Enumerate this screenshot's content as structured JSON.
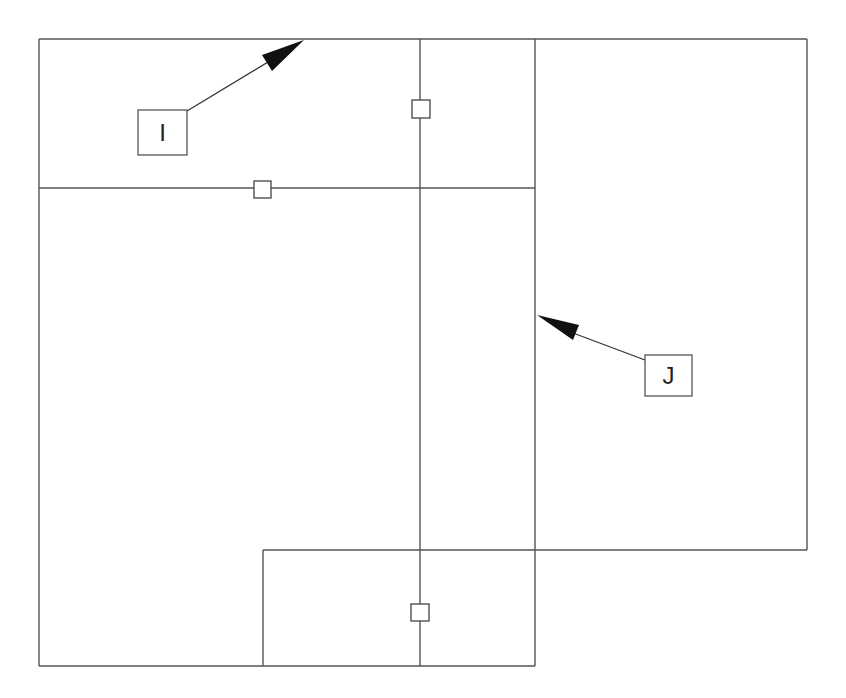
{
  "diagram": {
    "type": "floor-plan-outline",
    "canvas": {
      "width": 846,
      "height": 698,
      "background": "#ffffff"
    },
    "line_color": "#555555",
    "labels": [
      {
        "id": "I",
        "text": "I",
        "box": {
          "x": 138,
          "y": 110,
          "w": 49,
          "h": 45
        },
        "arrow_to": {
          "x": 304,
          "y": 40
        },
        "points_at": "top edge of upper-left region"
      },
      {
        "id": "J",
        "text": "J",
        "box": {
          "x": 645,
          "y": 355,
          "w": 47,
          "h": 41
        },
        "arrow_to": {
          "x": 537,
          "y": 315
        },
        "points_at": "left edge of right region (x=535)"
      }
    ],
    "markers": [
      {
        "name": "marker-upper-vertical",
        "x": 421,
        "y": 109
      },
      {
        "name": "marker-left-horizontal",
        "x": 262,
        "y": 190
      },
      {
        "name": "marker-lower-vertical",
        "x": 420,
        "y": 612
      }
    ]
  }
}
